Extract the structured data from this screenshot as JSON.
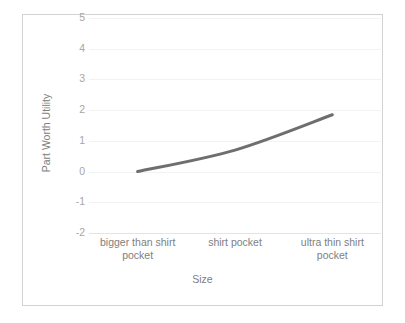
{
  "chart_data": {
    "type": "line",
    "title": "",
    "subtitle": "",
    "xlabel": "Size",
    "ylabel": "Part Worth Utility",
    "categories": [
      "bigger than shirt pocket",
      "shirt pocket",
      "ultra thin shirt pocket"
    ],
    "series": [
      {
        "name": "Part Worth Utility",
        "values": [
          0.0,
          0.7,
          1.85
        ]
      }
    ],
    "ylim": [
      -2,
      5
    ],
    "ytick_labels": [
      "5",
      "4",
      "3",
      "2",
      "1",
      "0",
      "-1",
      "-2"
    ],
    "ytick_values": [
      5,
      4,
      3,
      2,
      1,
      0,
      -1,
      -2
    ],
    "grid": true,
    "legend": false,
    "legend_position": "none",
    "markers": false,
    "annotations": []
  },
  "style": {
    "line_color": "#6e6e6e",
    "gridline_color": "#f2f2f2",
    "axis_color": "#e4e4e4",
    "tick_text_color": "#a6a6a6",
    "title_text_color": "#808080",
    "frame_border_color": "#d2d2d2",
    "background_color": "#ffffff"
  }
}
